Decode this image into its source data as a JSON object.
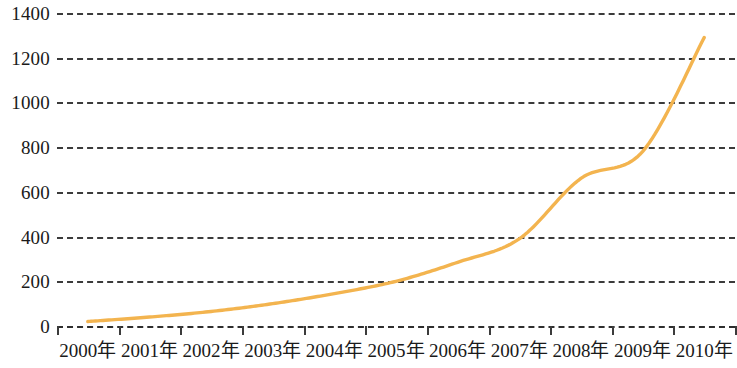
{
  "chart_data": {
    "type": "line",
    "title": "",
    "subtitle": "",
    "xlabel": "",
    "ylabel": "",
    "categories": [
      "2000年",
      "2001年",
      "2002年",
      "2003年",
      "2004年",
      "2005年",
      "2006年",
      "2007年",
      "2008年",
      "2009年",
      "2010年"
    ],
    "series": [
      {
        "name": "",
        "color": "#F3B44F",
        "values": [
          20,
          40,
          65,
          100,
          145,
          200,
          285,
          390,
          660,
          780,
          1290
        ]
      }
    ],
    "ylim": [
      0,
      1400
    ],
    "ytick_values": [
      0,
      200,
      400,
      600,
      800,
      1000,
      1200,
      1400
    ],
    "ytick_labels": [
      "0",
      "200",
      "400",
      "600",
      "800",
      "1000",
      "1200",
      "1400"
    ],
    "grid": "horizontal-dashed",
    "legend": "none",
    "annotations": []
  },
  "style": {
    "line_color": "#F3B44F",
    "grid_color": "#3b3b3b",
    "text_color": "#1a1a1a",
    "background": "#ffffff"
  }
}
